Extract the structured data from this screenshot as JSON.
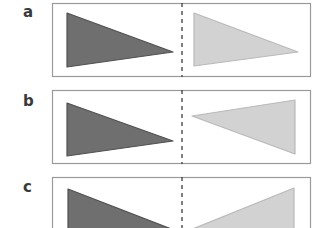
{
  "figure": {
    "panels": [
      {
        "label": "a",
        "description": "translation",
        "original_triangle": "dark",
        "image_triangle": "light"
      },
      {
        "label": "b",
        "description": "rotation",
        "original_triangle": "dark",
        "image_triangle": "light"
      },
      {
        "label": "c",
        "description": "reflection",
        "original_triangle": "dark",
        "image_triangle": "light"
      }
    ],
    "colors": {
      "dark_fill": "#6f6f6f",
      "dark_stroke": "#505050",
      "light_fill": "#d2d2d2",
      "light_stroke": "#b9b9b9",
      "box_stroke": "#9a9a9a",
      "axis": "#3c3c3c",
      "label": "#3a3a3a"
    }
  }
}
